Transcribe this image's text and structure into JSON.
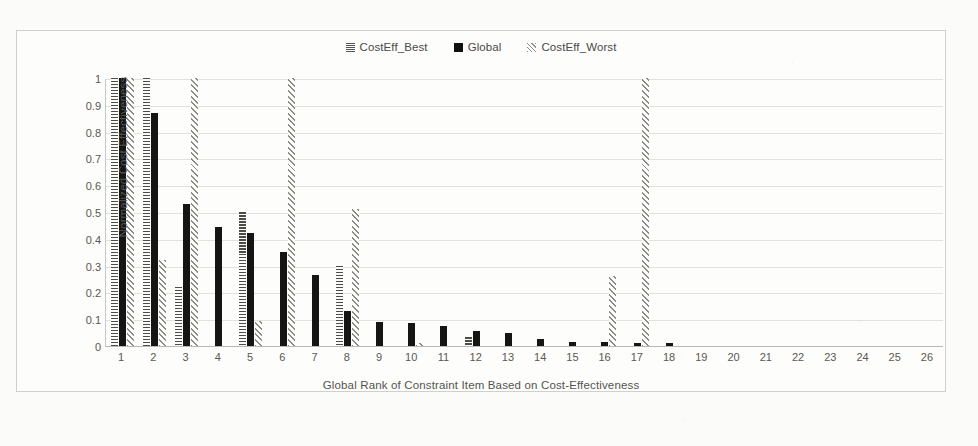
{
  "legend": {
    "position": "top-center",
    "entries": [
      {
        "label": "CostEff_Best",
        "icon": "legend-swatch-dashed",
        "color": "#55554f"
      },
      {
        "label": "Global",
        "icon": "legend-swatch-solid",
        "color": "#111111"
      },
      {
        "label": "CostEff_Worst",
        "icon": "legend-swatch-diagonal",
        "color": "#8f8f88"
      }
    ]
  },
  "axes": {
    "y_title": "Normalized Cost Effectiveness",
    "x_title": "Global Rank of Constraint Item Based on Cost-Effectiveness",
    "y_ticks": [
      "0",
      "0.1",
      "0.2",
      "0.3",
      "0.4",
      "0.5",
      "0.6",
      "0.7",
      "0.8",
      "0.9",
      "1"
    ]
  },
  "chart_data": {
    "type": "bar",
    "title": "",
    "xlabel": "Global Rank of Constraint Item Based on Cost-Effectiveness",
    "ylabel": "Normalized Cost Effectiveness",
    "ylim": [
      0,
      1
    ],
    "ytick_step": 0.1,
    "grid": true,
    "legend_position": "top-center",
    "categories": [
      "1",
      "2",
      "3",
      "4",
      "5",
      "6",
      "7",
      "8",
      "9",
      "10",
      "11",
      "12",
      "13",
      "14",
      "15",
      "16",
      "17",
      "18",
      "19",
      "20",
      "21",
      "22",
      "23",
      "24",
      "25",
      "26"
    ],
    "series": [
      {
        "name": "CostEff_Best",
        "color": "#55554f",
        "pattern": "horizontal-dash",
        "values": [
          1.0,
          1.0,
          0.22,
          0.0,
          0.5,
          0.0,
          0.0,
          0.3,
          0.0,
          0.0,
          0.0,
          0.035,
          0.0,
          0.0,
          0.0,
          0.0,
          0.0,
          0.0,
          0.0,
          0.0,
          0.0,
          0.0,
          0.0,
          0.0,
          0.0,
          0.0
        ]
      },
      {
        "name": "Global",
        "color": "#151513",
        "pattern": "solid",
        "values": [
          1.0,
          0.87,
          0.53,
          0.445,
          0.42,
          0.35,
          0.265,
          0.13,
          0.09,
          0.085,
          0.075,
          0.055,
          0.05,
          0.025,
          0.015,
          0.015,
          0.012,
          0.01,
          0.0,
          0.0,
          0.0,
          0.0,
          0.0,
          0.0,
          0.0,
          0.0
        ]
      },
      {
        "name": "CostEff_Worst",
        "color": "#8b8b84",
        "pattern": "diagonal-stripe",
        "values": [
          1.0,
          0.32,
          1.0,
          0.0,
          0.095,
          1.0,
          0.0,
          0.51,
          0.0,
          0.01,
          0.0,
          0.0,
          0.0,
          0.0,
          0.0,
          0.26,
          1.0,
          0.0,
          0.0,
          0.0,
          0.0,
          0.0,
          0.0,
          0.0,
          0.0,
          0.0
        ]
      }
    ]
  }
}
